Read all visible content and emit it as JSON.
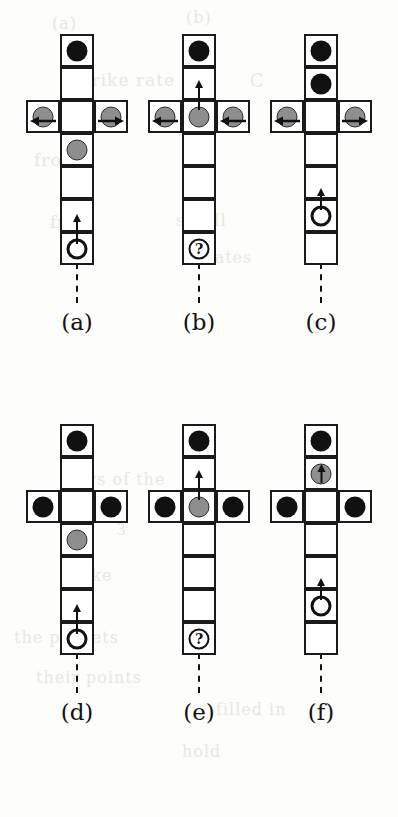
{
  "figure": {
    "kind": "six-panel cell-transition diagram",
    "cell_count_vertical": 7,
    "cell_count_horizontal_arm": 3,
    "junction_row_index": 3,
    "colors": {
      "stroke": "#1a1a1a",
      "black_token": "#111111",
      "gray_token": "#8e8e8e",
      "open_token_fill": "#ffffff",
      "page": "#fdfdfb"
    },
    "panels": [
      {
        "label": "(a)",
        "caption": "(a)",
        "left": 14,
        "top": 28,
        "shaft": [
          {
            "row": 1,
            "token": "black",
            "arrow": "none"
          },
          {
            "row": 2,
            "token": "none",
            "arrow": "none"
          },
          {
            "row": 3,
            "token": "none",
            "arrow": "none",
            "junction": true
          },
          {
            "row": 4,
            "token": "gray",
            "arrow": "none"
          },
          {
            "row": 5,
            "token": "none",
            "arrow": "none"
          },
          {
            "row": 6,
            "token": "none",
            "arrow": "none"
          },
          {
            "row": 7,
            "token": "open",
            "arrow": "up-tall"
          }
        ],
        "arm": [
          {
            "side": "left",
            "token": "gray",
            "arrow": "left"
          },
          {
            "side": "right",
            "token": "gray",
            "arrow": "right"
          }
        ],
        "tail": true
      },
      {
        "label": "(b)",
        "caption": "(b)",
        "left": 136,
        "top": 28,
        "shaft": [
          {
            "row": 1,
            "token": "black",
            "arrow": "none"
          },
          {
            "row": 2,
            "token": "none",
            "arrow": "none"
          },
          {
            "row": 3,
            "token": "gray",
            "arrow": "up-tall",
            "junction": true
          },
          {
            "row": 4,
            "token": "none",
            "arrow": "none"
          },
          {
            "row": 5,
            "token": "none",
            "arrow": "none"
          },
          {
            "row": 6,
            "token": "none",
            "arrow": "none"
          },
          {
            "row": 7,
            "token": "query",
            "arrow": "none",
            "text": "?"
          }
        ],
        "arm": [
          {
            "side": "left",
            "token": "gray",
            "arrow": "left"
          },
          {
            "side": "right",
            "token": "gray",
            "arrow": "left"
          }
        ],
        "tail": true
      },
      {
        "label": "(c)",
        "caption": "(c)",
        "left": 258,
        "top": 28,
        "shaft": [
          {
            "row": 1,
            "token": "black",
            "arrow": "none"
          },
          {
            "row": 2,
            "token": "black",
            "arrow": "none"
          },
          {
            "row": 3,
            "token": "none",
            "arrow": "none",
            "junction": true
          },
          {
            "row": 4,
            "token": "none",
            "arrow": "none"
          },
          {
            "row": 5,
            "token": "none",
            "arrow": "none"
          },
          {
            "row": 6,
            "token": "open",
            "arrow": "up-short"
          },
          {
            "row": 7,
            "token": "none",
            "arrow": "none"
          }
        ],
        "arm": [
          {
            "side": "left",
            "token": "gray",
            "arrow": "left"
          },
          {
            "side": "right",
            "token": "gray",
            "arrow": "right"
          }
        ],
        "tail": true
      },
      {
        "label": "(d)",
        "caption": "(d)",
        "left": 14,
        "top": 418,
        "shaft": [
          {
            "row": 1,
            "token": "black",
            "arrow": "none"
          },
          {
            "row": 2,
            "token": "none",
            "arrow": "none"
          },
          {
            "row": 3,
            "token": "none",
            "arrow": "none",
            "junction": true
          },
          {
            "row": 4,
            "token": "gray",
            "arrow": "none"
          },
          {
            "row": 5,
            "token": "none",
            "arrow": "none"
          },
          {
            "row": 6,
            "token": "none",
            "arrow": "none"
          },
          {
            "row": 7,
            "token": "open",
            "arrow": "up-tall"
          }
        ],
        "arm": [
          {
            "side": "left",
            "token": "black",
            "arrow": "none"
          },
          {
            "side": "right",
            "token": "black",
            "arrow": "none"
          }
        ],
        "tail": true
      },
      {
        "label": "(e)",
        "caption": "(e)",
        "left": 136,
        "top": 418,
        "shaft": [
          {
            "row": 1,
            "token": "black",
            "arrow": "none"
          },
          {
            "row": 2,
            "token": "none",
            "arrow": "none"
          },
          {
            "row": 3,
            "token": "gray",
            "arrow": "up-tall",
            "junction": true
          },
          {
            "row": 4,
            "token": "none",
            "arrow": "none"
          },
          {
            "row": 5,
            "token": "none",
            "arrow": "none"
          },
          {
            "row": 6,
            "token": "none",
            "arrow": "none"
          },
          {
            "row": 7,
            "token": "query",
            "arrow": "none",
            "text": "?"
          }
        ],
        "arm": [
          {
            "side": "left",
            "token": "black",
            "arrow": "none"
          },
          {
            "side": "right",
            "token": "black",
            "arrow": "none"
          }
        ],
        "tail": true
      },
      {
        "label": "(f)",
        "caption": "(f)",
        "left": 258,
        "top": 418,
        "shaft": [
          {
            "row": 1,
            "token": "black",
            "arrow": "none"
          },
          {
            "row": 2,
            "token": "gray",
            "arrow": "inside-up"
          },
          {
            "row": 3,
            "token": "none",
            "arrow": "none",
            "junction": true
          },
          {
            "row": 4,
            "token": "none",
            "arrow": "none"
          },
          {
            "row": 5,
            "token": "none",
            "arrow": "none"
          },
          {
            "row": 6,
            "token": "open",
            "arrow": "up-short"
          },
          {
            "row": 7,
            "token": "none",
            "arrow": "none"
          }
        ],
        "arm": [
          {
            "side": "left",
            "token": "black",
            "arrow": "none"
          },
          {
            "side": "right",
            "token": "black",
            "arrow": "none"
          }
        ],
        "tail": true
      }
    ]
  },
  "background_bleed": [
    {
      "text": "(a)",
      "left": 52,
      "top": 14,
      "size": 16
    },
    {
      "text": "(b)",
      "left": 186,
      "top": 8,
      "size": 16
    },
    {
      "text": "strike rate",
      "left": 74,
      "top": 70,
      "size": 17
    },
    {
      "text": "C",
      "left": 250,
      "top": 70,
      "size": 18
    },
    {
      "text": "from",
      "left": 34,
      "top": 150,
      "size": 17
    },
    {
      "text": "small",
      "left": 176,
      "top": 210,
      "size": 17
    },
    {
      "text": "from",
      "left": 50,
      "top": 212,
      "size": 17
    },
    {
      "text": "rates",
      "left": 206,
      "top": 248,
      "size": 16
    },
    {
      "text": "3",
      "left": 312,
      "top": 318,
      "size": 16
    },
    {
      "text": "stays of the",
      "left": 60,
      "top": 470,
      "size": 16
    },
    {
      "text": "3",
      "left": 116,
      "top": 520,
      "size": 16
    },
    {
      "text": "strike",
      "left": 60,
      "top": 566,
      "size": 16
    },
    {
      "text": "the packets",
      "left": 14,
      "top": 628,
      "size": 16
    },
    {
      "text": "their points",
      "left": 36,
      "top": 668,
      "size": 16
    },
    {
      "text": "filled in",
      "left": 216,
      "top": 700,
      "size": 16
    },
    {
      "text": "hold",
      "left": 182,
      "top": 742,
      "size": 16
    }
  ]
}
